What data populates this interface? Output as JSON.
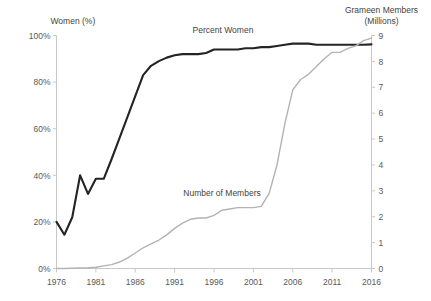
{
  "chart_data": {
    "type": "line",
    "title": "",
    "xlabel": "",
    "grid": false,
    "legend_position": "inline-annotations",
    "x": [
      1976,
      1977,
      1978,
      1979,
      1980,
      1981,
      1982,
      1983,
      1984,
      1985,
      1986,
      1987,
      1988,
      1989,
      1990,
      1991,
      1992,
      1993,
      1994,
      1995,
      1996,
      1997,
      1998,
      1999,
      2000,
      2001,
      2002,
      2003,
      2004,
      2005,
      2006,
      2007,
      2008,
      2009,
      2010,
      2011,
      2012,
      2013,
      2014,
      2015,
      2016
    ],
    "xlim": [
      1976,
      2016
    ],
    "xticks": [
      1976,
      1981,
      1986,
      1991,
      1996,
      2001,
      2006,
      2011,
      2016
    ],
    "xtick_labels": [
      "1976",
      "1981",
      "1986",
      "1991",
      "1996",
      "2001",
      "2006",
      "2011",
      "2016"
    ],
    "axes": [
      {
        "id": "left",
        "label": "Women (%)",
        "ylim": [
          0,
          100
        ],
        "yticks": [
          0,
          20,
          40,
          60,
          80,
          100
        ],
        "ytick_labels": [
          "0%",
          "20%",
          "40%",
          "60%",
          "80%",
          "100%"
        ]
      },
      {
        "id": "right",
        "label": "Grameen Members (Millions)",
        "label_line1": "Grameen Members",
        "label_line2": "(Millions)",
        "ylim": [
          0,
          9
        ],
        "yticks": [
          0,
          1,
          2,
          3,
          4,
          5,
          6,
          7,
          8,
          9
        ],
        "ytick_labels": [
          "0",
          "1",
          "2",
          "3",
          "4",
          "5",
          "6",
          "7",
          "8",
          "9"
        ]
      }
    ],
    "series": [
      {
        "name": "Percent Women",
        "axis": "left",
        "unit": "%",
        "color": "#242424",
        "annotation": "Percent Women",
        "values": [
          20,
          14.5,
          22,
          40,
          32,
          38.5,
          38.5,
          47,
          56,
          65,
          74,
          83,
          87,
          89,
          90.5,
          91.5,
          92,
          92,
          92,
          92.5,
          94,
          94,
          94,
          94,
          94.5,
          94.5,
          95,
          95,
          95.5,
          96,
          96.5,
          96.5,
          96.5,
          96,
          96,
          96,
          96,
          96,
          96,
          96,
          96.2
        ]
      },
      {
        "name": "Number of Members",
        "axis": "right",
        "unit": "Millions",
        "color": "#b3b3b3",
        "annotation": "Number of Members",
        "values": [
          0.0,
          0.0,
          0.01,
          0.02,
          0.03,
          0.05,
          0.1,
          0.15,
          0.25,
          0.4,
          0.6,
          0.8,
          0.95,
          1.1,
          1.3,
          1.55,
          1.75,
          1.9,
          1.95,
          1.95,
          2.05,
          2.25,
          2.3,
          2.35,
          2.35,
          2.35,
          2.4,
          2.9,
          4.0,
          5.6,
          6.9,
          7.3,
          7.5,
          7.8,
          8.1,
          8.35,
          8.35,
          8.5,
          8.6,
          8.8,
          8.9
        ]
      }
    ]
  }
}
